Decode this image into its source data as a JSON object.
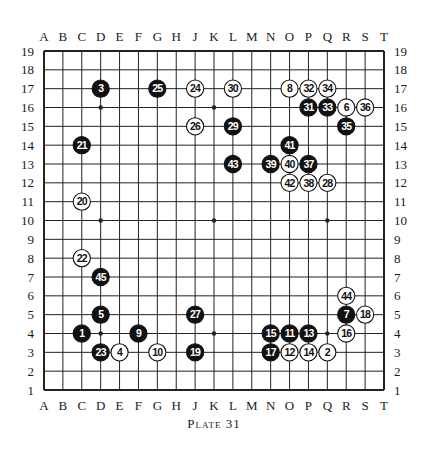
{
  "diagram": {
    "caption": "Plate 31",
    "board_size": 19,
    "columns": [
      "A",
      "B",
      "C",
      "D",
      "E",
      "F",
      "G",
      "H",
      "J",
      "K",
      "L",
      "M",
      "N",
      "O",
      "P",
      "Q",
      "R",
      "S",
      "T"
    ],
    "rows": [
      19,
      18,
      17,
      16,
      15,
      14,
      13,
      12,
      11,
      10,
      9,
      8,
      7,
      6,
      5,
      4,
      3,
      2,
      1
    ],
    "hoshi": [
      "D4",
      "K4",
      "Q4",
      "D10",
      "K10",
      "Q10",
      "D16",
      "K16",
      "Q16"
    ],
    "colors": {
      "black_stone": "#111111",
      "white_stone": "#ffffff",
      "line": "#222222",
      "background": "#ffffff"
    },
    "stones": [
      {
        "n": 1,
        "color": "black",
        "pos": "C4"
      },
      {
        "n": 2,
        "color": "white",
        "pos": "Q3"
      },
      {
        "n": 3,
        "color": "black",
        "pos": "D17"
      },
      {
        "n": 4,
        "color": "white",
        "pos": "E3"
      },
      {
        "n": 5,
        "color": "black",
        "pos": "D5"
      },
      {
        "n": 6,
        "color": "white",
        "pos": "R16"
      },
      {
        "n": 7,
        "color": "black",
        "pos": "R5"
      },
      {
        "n": 8,
        "color": "white",
        "pos": "O17"
      },
      {
        "n": 9,
        "color": "black",
        "pos": "F4"
      },
      {
        "n": 10,
        "color": "white",
        "pos": "G3"
      },
      {
        "n": 11,
        "color": "black",
        "pos": "O4"
      },
      {
        "n": 12,
        "color": "white",
        "pos": "O3"
      },
      {
        "n": 13,
        "color": "black",
        "pos": "P4"
      },
      {
        "n": 14,
        "color": "white",
        "pos": "P3"
      },
      {
        "n": 15,
        "color": "black",
        "pos": "N4"
      },
      {
        "n": 16,
        "color": "white",
        "pos": "R4"
      },
      {
        "n": 17,
        "color": "black",
        "pos": "N3"
      },
      {
        "n": 18,
        "color": "white",
        "pos": "S5"
      },
      {
        "n": 19,
        "color": "black",
        "pos": "J3"
      },
      {
        "n": 20,
        "color": "white",
        "pos": "C11"
      },
      {
        "n": 21,
        "color": "black",
        "pos": "C14"
      },
      {
        "n": 22,
        "color": "white",
        "pos": "C8"
      },
      {
        "n": 23,
        "color": "black",
        "pos": "D3"
      },
      {
        "n": 24,
        "color": "white",
        "pos": "J17"
      },
      {
        "n": 25,
        "color": "black",
        "pos": "G17"
      },
      {
        "n": 26,
        "color": "white",
        "pos": "J15"
      },
      {
        "n": 27,
        "color": "black",
        "pos": "J5"
      },
      {
        "n": 28,
        "color": "white",
        "pos": "Q12"
      },
      {
        "n": 29,
        "color": "black",
        "pos": "L15"
      },
      {
        "n": 30,
        "color": "white",
        "pos": "L17"
      },
      {
        "n": 31,
        "color": "black",
        "pos": "P16"
      },
      {
        "n": 32,
        "color": "white",
        "pos": "P17"
      },
      {
        "n": 33,
        "color": "black",
        "pos": "Q16"
      },
      {
        "n": 34,
        "color": "white",
        "pos": "Q17"
      },
      {
        "n": 35,
        "color": "black",
        "pos": "R15"
      },
      {
        "n": 36,
        "color": "white",
        "pos": "S16"
      },
      {
        "n": 37,
        "color": "black",
        "pos": "P13"
      },
      {
        "n": 38,
        "color": "white",
        "pos": "P12"
      },
      {
        "n": 39,
        "color": "black",
        "pos": "N13"
      },
      {
        "n": 40,
        "color": "white",
        "pos": "O13"
      },
      {
        "n": 41,
        "color": "black",
        "pos": "O14"
      },
      {
        "n": 42,
        "color": "white",
        "pos": "O12"
      },
      {
        "n": 43,
        "color": "black",
        "pos": "L13"
      },
      {
        "n": 44,
        "color": "white",
        "pos": "R6"
      },
      {
        "n": 45,
        "color": "black",
        "pos": "D7"
      }
    ]
  }
}
